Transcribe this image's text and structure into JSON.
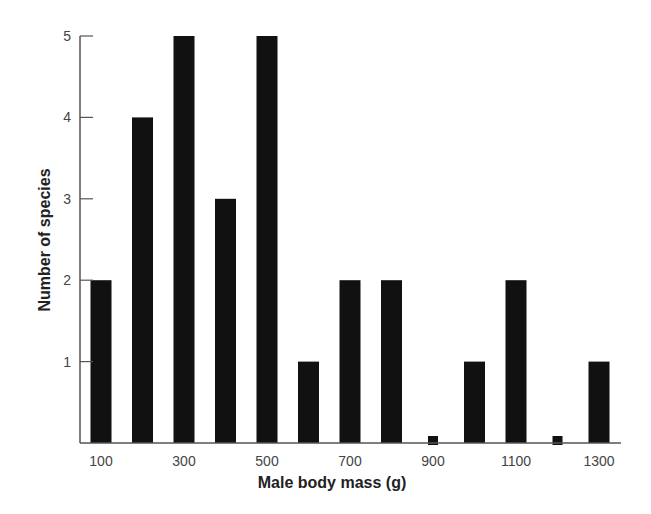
{
  "chart_data": {
    "type": "bar",
    "title": "",
    "xlabel": "Male body mass (g)",
    "ylabel": "Number of species",
    "categories": [
      "100",
      "200",
      "300",
      "400",
      "500",
      "600",
      "700",
      "800",
      "900",
      "1000",
      "1100",
      "1200",
      "1300"
    ],
    "values": [
      2,
      4,
      5,
      3,
      5,
      1,
      2,
      2,
      0,
      1,
      2,
      0,
      1
    ],
    "x_tick_labels": [
      "100",
      "300",
      "500",
      "700",
      "900",
      "1100",
      "1300"
    ],
    "y_tick_labels": [
      "1",
      "2",
      "3",
      "4",
      "5"
    ],
    "ylim": [
      0,
      5
    ],
    "grid": false,
    "legend": null,
    "zero_markers": [
      "900",
      "1200"
    ],
    "bar_color": "#111111",
    "axis_color": "#555555"
  }
}
